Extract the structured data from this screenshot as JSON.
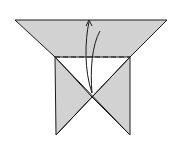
{
  "diagram": {
    "type": "origami-fold-step",
    "colors": {
      "paper": "#d2d2d2",
      "stroke": "#1a1a1a",
      "background": "#ffffff"
    },
    "elements": [
      {
        "kind": "paper-shape",
        "description": "inverted triangle top with two square flaps below"
      },
      {
        "kind": "valley-fold-line",
        "style": "dashed",
        "orientation": "horizontal"
      },
      {
        "kind": "fold-arrow",
        "direction": "up"
      }
    ]
  }
}
